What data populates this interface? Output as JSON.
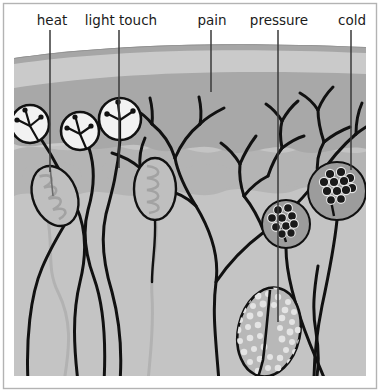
{
  "figure": {
    "title_visible": false,
    "kind": "skin-sensory-receptor-diagram",
    "canvas": {
      "width": 380,
      "height": 392
    },
    "background_color": "#ffffff",
    "border_color": "#b0b0b0"
  },
  "labels": [
    {
      "id": "heat",
      "text": "heat",
      "x": 52,
      "y": 22,
      "leader_x": 50,
      "leader_y1": 30,
      "leader_y2": 172
    },
    {
      "id": "light-touch",
      "text": "light touch",
      "x": 121,
      "y": 22,
      "leader_x": 119,
      "leader_y1": 30,
      "leader_y2": 168
    },
    {
      "id": "pain",
      "text": "pain",
      "x": 212,
      "y": 22,
      "leader_x": 211,
      "leader_y1": 30,
      "leader_y2": 92
    },
    {
      "id": "pressure",
      "text": "pressure",
      "x": 279,
      "y": 22,
      "leader_x": 278,
      "leader_y1": 30,
      "leader_y2": 322
    },
    {
      "id": "cold",
      "text": "cold",
      "x": 352,
      "y": 22,
      "leader_x": 351,
      "leader_y1": 30,
      "leader_y2": 170
    }
  ],
  "skin_layers": [
    {
      "id": "stratum-corneum",
      "label_visible": false,
      "color": "#a9a9a9"
    },
    {
      "id": "epidermis",
      "label_visible": false,
      "color": "#c8c8c8"
    },
    {
      "id": "dermis-upper",
      "label_visible": false,
      "color": "#a8a8a8"
    },
    {
      "id": "dermis-papillae",
      "label_visible": false,
      "color": "#b4b4b4"
    },
    {
      "id": "dermis-lower",
      "label_visible": false,
      "color": "#c4c4c4"
    },
    {
      "id": "subcutaneous",
      "label_visible": false,
      "color": "#cbcbcb"
    }
  ],
  "receptors": [
    {
      "id": "free-nerve-ending-1",
      "type": "free-nerve-ending-circle",
      "label_ref": "heat",
      "cx": 30,
      "cy": 124,
      "r": 19
    },
    {
      "id": "free-nerve-ending-2",
      "type": "free-nerve-ending-circle",
      "label_ref": "heat",
      "cx": 80,
      "cy": 131,
      "r": 19
    },
    {
      "id": "free-nerve-ending-3",
      "type": "free-nerve-ending-circle",
      "label_ref": "heat",
      "cx": 120,
      "cy": 119,
      "r": 21
    },
    {
      "id": "meissner-corpuscle-1",
      "type": "coiled-oval",
      "label_ref": "light touch",
      "cx": 55,
      "cy": 196,
      "rx": 22,
      "ry": 31,
      "rotation": -22
    },
    {
      "id": "meissner-corpuscle-2",
      "type": "coiled-oval",
      "label_ref": "light touch",
      "cx": 155,
      "cy": 189,
      "rx": 21,
      "ry": 31,
      "rotation": 0
    },
    {
      "id": "krause-end-bulb-1",
      "type": "grape-cluster-circle",
      "label_ref": "cold",
      "cx": 286,
      "cy": 224,
      "r": 24
    },
    {
      "id": "krause-end-bulb-2",
      "type": "grape-cluster-circle",
      "label_ref": "cold",
      "cx": 337,
      "cy": 191,
      "r": 29
    },
    {
      "id": "pacinian-corpuscle",
      "type": "stippled-oval",
      "label_ref": "pressure",
      "cx": 269,
      "cy": 332,
      "rx": 31,
      "ry": 45,
      "rotation": 12
    },
    {
      "id": "free-nerve-branches-left",
      "type": "branching-nerve-tree",
      "label_ref": "pain"
    },
    {
      "id": "free-nerve-branches-right",
      "type": "branching-nerve-tree",
      "label_ref": "pain"
    }
  ],
  "colors": {
    "ink": "#111111",
    "label_text": "#1b1b1b",
    "leader_line": "#3a3a3a",
    "nerve_dark": "#111111",
    "nerve_light": "#b2b2b2",
    "coil_fill": "#bdbdbd",
    "bulb_fill": "#9a9a9a",
    "stipple_fill": "#b8b8b8",
    "stipple_dot": "#e2e2e2",
    "frame": "#b3b3b3"
  }
}
